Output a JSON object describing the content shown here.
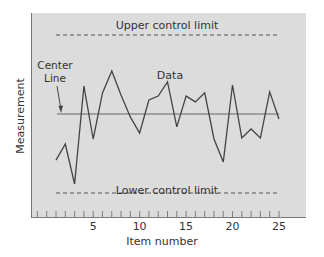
{
  "chart_data": {
    "type": "line",
    "title": "",
    "xlabel": "Item number",
    "ylabel": "Measurement",
    "x_ticks": [
      5,
      10,
      15,
      20,
      25
    ],
    "x": [
      1,
      2,
      3,
      4,
      5,
      6,
      7,
      8,
      9,
      10,
      11,
      12,
      13,
      14,
      15,
      16,
      17,
      18,
      19,
      20,
      21,
      22,
      23,
      24,
      25
    ],
    "series": [
      {
        "name": "Data",
        "values": [
          -1.75,
          -1.14,
          -2.66,
          1.06,
          -0.95,
          0.8,
          1.63,
          0.72,
          -0.11,
          -0.72,
          0.53,
          0.68,
          1.22,
          -0.49,
          0.68,
          0.46,
          0.8,
          -0.95,
          -1.82,
          1.1,
          -0.91,
          -0.57,
          -0.91,
          0.84,
          -0.19
        ]
      }
    ],
    "center_line": 0,
    "upper_control_limit": 3,
    "lower_control_limit": -3,
    "ylim": [
      -3.6,
      3.8
    ],
    "xlim": [
      -1,
      28
    ],
    "grid": false,
    "legend": "none",
    "annotations": [
      {
        "text": "Upper control limit",
        "target": "upper_control_limit"
      },
      {
        "text": "Lower control limit",
        "target": "lower_control_limit"
      },
      {
        "text": "Center Line",
        "target": "center_line",
        "arrow": true
      },
      {
        "text": "Data",
        "target": "series"
      }
    ]
  },
  "labels": {
    "ucl": "Upper control limit",
    "lcl": "Lower control limit",
    "center_line_1": "Center",
    "center_line_2": "Line",
    "data": "Data",
    "xlabel": "Item number",
    "ylabel": "Measurement"
  },
  "colors": {
    "plot_bg": "#dcdcdc",
    "line": "#444444",
    "axis": "#666666",
    "text": "#333333"
  }
}
